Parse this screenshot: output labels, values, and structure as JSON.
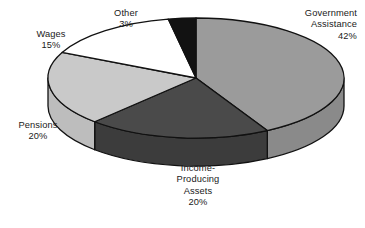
{
  "chart_data": {
    "type": "pie",
    "title": "",
    "subtitle": "",
    "xlabel": "",
    "ylabel": "",
    "legend_position": "none",
    "grid": false,
    "three_d": true,
    "unit": "%",
    "categories": [
      "Government Assistance",
      "Income-Producing Assets",
      "Pensions",
      "Wages",
      "Other"
    ],
    "values": [
      42,
      20,
      20,
      15,
      3
    ],
    "colors": [
      "#9b9b9b",
      "#4a4a4a",
      "#c9c9c9",
      "#ffffff",
      "#121212"
    ],
    "slices": [
      {
        "name": "Government Assistance",
        "value": 42,
        "label_lines": [
          "Government",
          "Assistance",
          "42%"
        ],
        "percent_text": "42%",
        "color": "#9b9b9b",
        "side_color": "#8a8a8a"
      },
      {
        "name": "Income-Producing Assets",
        "value": 20,
        "label_lines": [
          "Income-",
          "Producing",
          "Assets",
          "20%"
        ],
        "percent_text": "20%",
        "color": "#4a4a4a",
        "side_color": "#3c3c3c"
      },
      {
        "name": "Pensions",
        "value": 20,
        "label_lines": [
          "Pensions",
          "20%"
        ],
        "percent_text": "20%",
        "color": "#c9c9c9",
        "side_color": "#bdbdbd"
      },
      {
        "name": "Wages",
        "value": 15,
        "label_lines": [
          "Wages",
          "15%"
        ],
        "percent_text": "15%",
        "color": "#ffffff",
        "side_color": "#f0f0f0"
      },
      {
        "name": "Other",
        "value": 3,
        "label_lines": [
          "Other",
          "3%"
        ],
        "percent_text": "3%",
        "color": "#121212",
        "side_color": "#0d0d0d"
      }
    ]
  },
  "labels": {
    "government": {
      "l1": "Government",
      "l2": "Assistance",
      "l3": "42%"
    },
    "other": {
      "l1": "Other",
      "l2": "3%"
    },
    "wages": {
      "l1": "Wages",
      "l2": "15%"
    },
    "pensions": {
      "l1": "Pensions",
      "l2": "20%"
    },
    "income": {
      "l1": "Income-",
      "l2": "Producing",
      "l3": "Assets",
      "l4": "20%"
    }
  },
  "style": {
    "background": "#ffffff",
    "outline": "#111111",
    "text": "#1a1a1a"
  }
}
